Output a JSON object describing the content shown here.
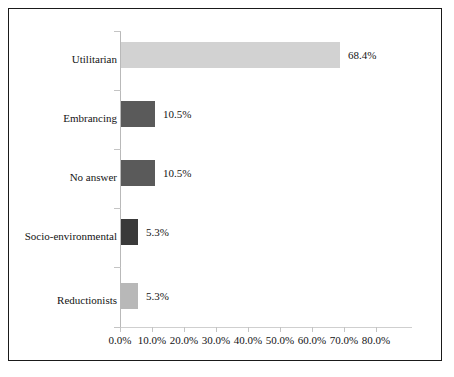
{
  "chart_data": {
    "type": "bar",
    "orientation": "horizontal",
    "title": "",
    "subtitle": "",
    "xlabel": "",
    "ylabel": "",
    "xlim": [
      0,
      80
    ],
    "grid": false,
    "legend": null,
    "categories": [
      "Utilitarian",
      "Embrancing",
      "No answer",
      "Socio-environmental",
      "Reductionists"
    ],
    "values": [
      68.4,
      10.5,
      10.5,
      5.3,
      5.3
    ],
    "value_labels": [
      "68.4%",
      "10.5%",
      "10.5%",
      "5.3%",
      "5.3%"
    ],
    "bar_colors": [
      "#d2d2d2",
      "#5a5a5a",
      "#5a5a5a",
      "#3a3a3a",
      "#b8b8b8"
    ],
    "xticks": [
      0,
      10,
      20,
      30,
      40,
      50,
      60,
      70,
      80
    ],
    "xtick_labels": [
      "0.0%",
      "10.0%",
      "20.0%",
      "30.0%",
      "40.0%",
      "50.0%",
      "60.0%",
      "70.0%",
      "80.0%"
    ],
    "bars": [
      {
        "category": "Utilitarian",
        "value": 68.4,
        "label": "68.4%",
        "color": "#d2d2d2"
      },
      {
        "category": "Embrancing",
        "value": 10.5,
        "label": "10.5%",
        "color": "#5a5a5a"
      },
      {
        "category": "No answer",
        "value": 10.5,
        "label": "10.5%",
        "color": "#5a5a5a"
      },
      {
        "category": "Socio-environmental",
        "value": 5.3,
        "label": "5.3%",
        "color": "#3a3a3a"
      },
      {
        "category": "Reductionists",
        "value": 5.3,
        "label": "5.3%",
        "color": "#b8b8b8"
      }
    ]
  },
  "frame": {
    "border_color": "#1a1a1a",
    "background": "#ffffff"
  }
}
